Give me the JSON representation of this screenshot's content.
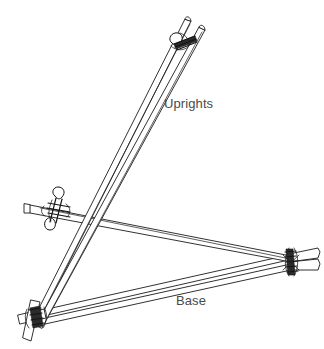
{
  "figure": {
    "type": "technical-line-drawing",
    "background_color": "#ffffff",
    "stroke_color": "#1b1b1b",
    "label_color": "#4a4a4a",
    "canvas": {
      "width": 324,
      "height": 349
    }
  },
  "labels": {
    "uprights": "Uprights",
    "base": "Base"
  },
  "members": [
    {
      "id": "upright-left",
      "name": "Upright pole (left / rear)",
      "group": "uprights",
      "from": [
        34,
        322
      ],
      "to": [
        187,
        20
      ]
    },
    {
      "id": "upright-right",
      "name": "Upright pole (right / front)",
      "group": "uprights",
      "from": [
        34,
        322
      ],
      "to": [
        202,
        28
      ]
    },
    {
      "id": "ledger",
      "name": "Horizontal ledger pole",
      "group": "cross-brace",
      "from": [
        43,
        211
      ],
      "to": [
        292,
        262
      ]
    },
    {
      "id": "base-rear",
      "name": "Base pole (rear leg)",
      "group": "base",
      "from": [
        34,
        322
      ],
      "to": [
        292,
        262
      ]
    },
    {
      "id": "base-front",
      "name": "Base pole (front leg)",
      "group": "base",
      "from": [
        34,
        322
      ],
      "to": [
        298,
        266
      ]
    }
  ],
  "lashings": [
    {
      "id": "lashing-apex",
      "name": "Apex shear lashing",
      "position": [
        182,
        38
      ],
      "joins": [
        "upright-left",
        "upright-right"
      ]
    },
    {
      "id": "lashing-mid-left",
      "name": "Mid square lashing",
      "position": [
        58,
        208
      ],
      "joins": [
        "upright-left",
        "upright-right",
        "ledger"
      ]
    },
    {
      "id": "lashing-foot-left",
      "name": "Left foot lashing",
      "position": [
        39,
        318
      ],
      "joins": [
        "upright-left",
        "upright-right",
        "base-rear",
        "base-front"
      ]
    },
    {
      "id": "lashing-right-corner",
      "name": "Right corner lashing",
      "position": [
        291,
        262
      ],
      "joins": [
        "ledger",
        "base-rear",
        "base-front"
      ]
    }
  ]
}
